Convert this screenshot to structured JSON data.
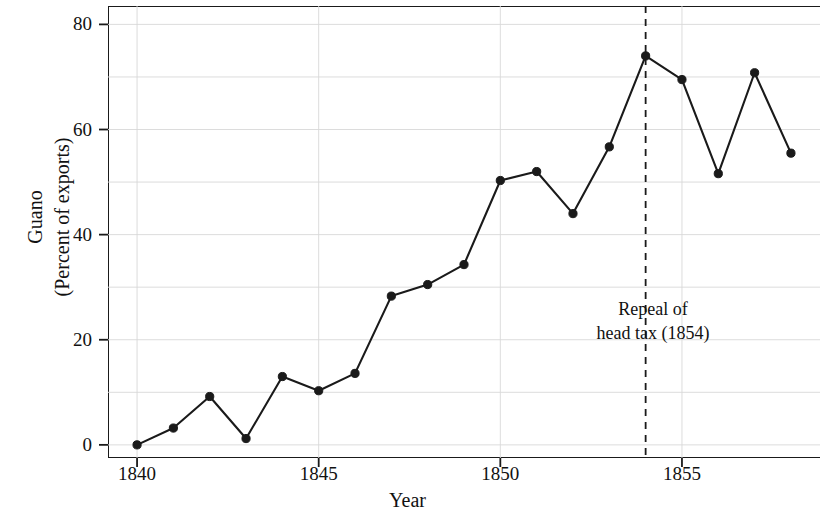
{
  "chart_data": {
    "type": "line",
    "title": "",
    "xlabel": "Year",
    "ylabel": "Guano\n(Percent of exports)",
    "ylabel_lines": [
      "Guano",
      "(Percent of exports)"
    ],
    "xlim": [
      1839.2,
      1858.8
    ],
    "ylim": [
      -2.5,
      83.5
    ],
    "xticks": [
      1840,
      1845,
      1850,
      1855
    ],
    "xtick_labels": [
      "1840",
      "1845",
      "1850",
      "1855"
    ],
    "yticks": [
      0,
      20,
      40,
      60,
      80
    ],
    "ytick_labels": [
      "0",
      "20",
      "40",
      "60",
      "80"
    ],
    "grid": true,
    "grid_x_values": [
      1840,
      1845,
      1850,
      1855
    ],
    "grid_y_values": [
      0,
      10,
      20,
      30,
      40,
      50,
      60,
      70,
      80
    ],
    "legend": "none",
    "marker": "filled-circle",
    "line_color": "#1a1a1a",
    "marker_color": "#1a1a1a",
    "grid_color": "#d8d8d8",
    "axis_color": "#1a1a1a",
    "x": [
      1840,
      1841,
      1842,
      1843,
      1844,
      1845,
      1846,
      1847,
      1848,
      1849,
      1850,
      1851,
      1852,
      1853,
      1854,
      1855,
      1856,
      1857,
      1858
    ],
    "values": [
      0.0,
      3.2,
      9.2,
      1.2,
      13.0,
      10.3,
      13.6,
      28.3,
      30.5,
      34.3,
      50.3,
      52.0,
      44.0,
      56.7,
      74.0,
      69.5,
      51.6,
      70.8,
      55.5
    ],
    "annotations": [
      {
        "type": "vline",
        "x": 1854,
        "style": "dashed",
        "color": "#1a1a1a",
        "text_lines": [
          "Repeal of",
          "head tax (1854)"
        ],
        "text": "Repeal of head tax (1854)"
      }
    ]
  },
  "axes": {
    "x_title": "Year",
    "y_title_line1": "Guano",
    "y_title_line2": "(Percent of exports)"
  },
  "annotation": {
    "line1": "Repeal of",
    "line2": "head tax (1854)"
  }
}
